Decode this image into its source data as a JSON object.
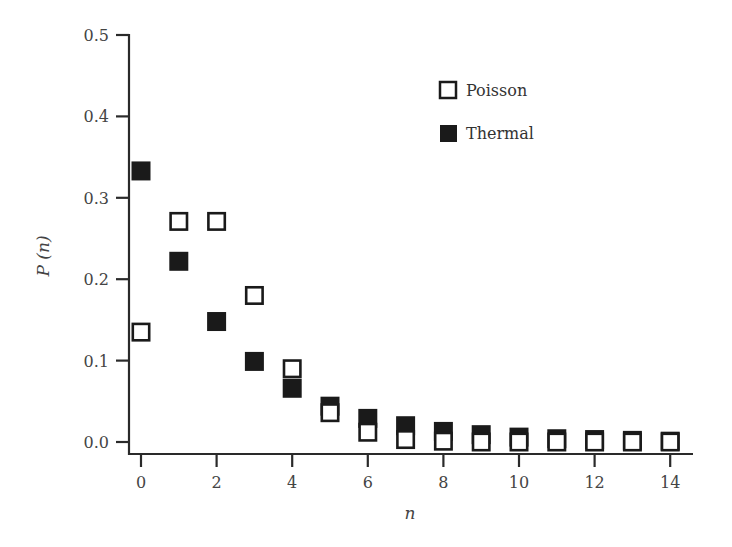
{
  "chart_data": {
    "type": "scatter",
    "title": "",
    "xlabel": "n",
    "ylabel": "P (n)",
    "xlim": [
      -0.3,
      14.6
    ],
    "ylim": [
      -0.015,
      0.5
    ],
    "xticks": [
      0,
      2,
      4,
      6,
      8,
      10,
      12,
      14
    ],
    "xtick_labels": [
      "0",
      "2",
      "4",
      "6",
      "8",
      "10",
      "12",
      "14"
    ],
    "yticks": [
      0.0,
      0.1,
      0.2,
      0.3,
      0.4,
      0.5
    ],
    "ytick_labels": [
      "0.0",
      "0.1",
      "0.2",
      "0.3",
      "0.4",
      "0.5"
    ],
    "grid": false,
    "legend_position": "upper right (inside)",
    "x": [
      0,
      1,
      2,
      3,
      4,
      5,
      6,
      7,
      8,
      9,
      10,
      11,
      12,
      13,
      14
    ],
    "series": [
      {
        "name": "Thermal",
        "marker": "filled-square",
        "color": "#1a1a1a",
        "values": [
          0.333,
          0.222,
          0.148,
          0.099,
          0.066,
          0.044,
          0.029,
          0.02,
          0.013,
          0.009,
          0.006,
          0.004,
          0.003,
          0.002,
          0.001
        ]
      },
      {
        "name": "Poisson",
        "marker": "open-square",
        "color": "#1a1a1a",
        "values": [
          0.135,
          0.271,
          0.271,
          0.18,
          0.09,
          0.036,
          0.012,
          0.003,
          0.001,
          0.0,
          0.0,
          0.0,
          0.0,
          0.0,
          0.0
        ]
      }
    ]
  },
  "legend": {
    "items": [
      {
        "label": "Poisson",
        "marker": "open-square"
      },
      {
        "label": "Thermal",
        "marker": "filled-square"
      }
    ]
  },
  "axes": {
    "x_title": "n",
    "y_title": "P (n)"
  }
}
